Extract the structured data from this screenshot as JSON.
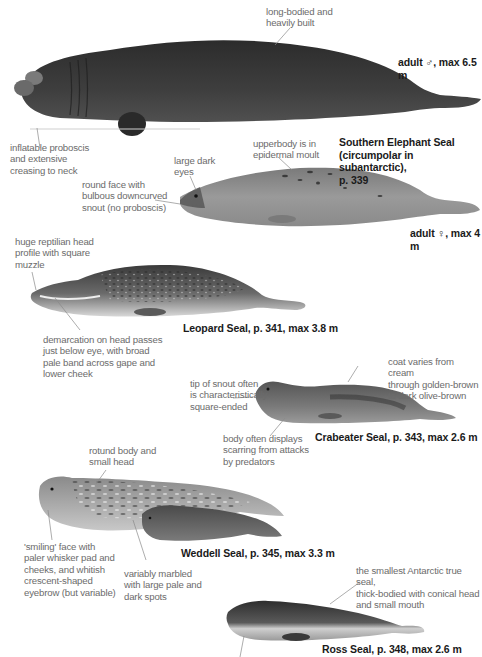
{
  "plate": {
    "species": [
      {
        "id": "southern-elephant-seal",
        "caption": "Southern Elephant Seal\n(circumpolar in subantarctic),\np. 339",
        "forms": [
          {
            "label": "adult ♂, max 6.5 m",
            "notes": [
              "long-bodied and\nheavily built",
              "inflatable proboscis\nand extensive\ncreasing to neck"
            ]
          },
          {
            "label": "adult ♀, max 4 m",
            "notes": [
              "upperbody is in\nepidermal moult",
              "large dark\neyes",
              "round face with\nbulbous downcurved\nsnout (no proboscis)"
            ]
          }
        ]
      },
      {
        "id": "leopard-seal",
        "caption": "Leopard Seal, p. 341, max 3.8 m",
        "notes": [
          "huge reptilian head\nprofile with square\nmuzzle",
          "demarcation on head passes\njust below eye, with broad\npale band across gape and\nlower cheek"
        ]
      },
      {
        "id": "crabeater-seal",
        "caption": "Crabeater Seal, p. 343, max 2.6 m",
        "notes": [
          "coat varies from cream\nthrough golden-brown\nto dark olive-brown",
          "tip of snout often\nis characteristically\nsquare-ended",
          "body often displays\nscarring from attacks\nby predators"
        ]
      },
      {
        "id": "weddell-seal",
        "caption": "Weddell Seal, p. 345, max 3.3 m",
        "notes": [
          "rotund body and\nsmall head",
          "'smiling' face with\npaler whisker pad and\ncheeks, and whitish\ncrescent-shaped\neyebrow (but variable)",
          "variably marbled\nwith large pale and\ndark spots"
        ]
      },
      {
        "id": "ross-seal",
        "caption": "Ross Seal, p. 348, max 2.6 m",
        "notes": [
          "the smallest Antarctic true seal,\nthick-bodied with conical head\nand small mouth"
        ]
      }
    ],
    "colors": {
      "note_text": "#6b6b6b",
      "caption_text": "#1a1a1a",
      "leader_line": "#8a8a8a",
      "elephant_male": "#3a3a3a",
      "elephant_female": "#8e8e8e",
      "leopard": "#5a5a5a",
      "crabeater": "#6c6c6c",
      "weddell": "#7a7a7a",
      "ross": "#4a4a4a"
    }
  }
}
